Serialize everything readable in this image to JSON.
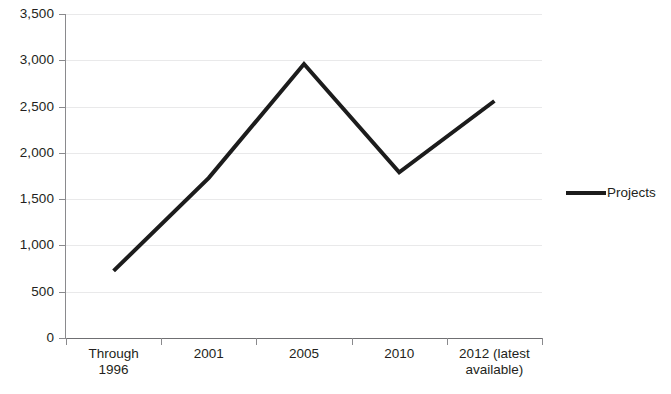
{
  "chart_data": {
    "type": "line",
    "title": "",
    "subtitle": "",
    "xlabel": "",
    "ylabel": "",
    "categories": [
      "Through 1996",
      "2001",
      "2005",
      "2010",
      "2012 (latest available)"
    ],
    "category_lines": [
      [
        "Through",
        "1996"
      ],
      [
        "2001"
      ],
      [
        "2005"
      ],
      [
        "2010"
      ],
      [
        "2012 (latest",
        "available)"
      ]
    ],
    "series": [
      {
        "name": "Projects",
        "values": [
          725,
          1730,
          2960,
          1790,
          2560
        ],
        "color": "#1c1c1c",
        "line_width": 4
      }
    ],
    "ylim": [
      0,
      3500
    ],
    "ytick_step": 500,
    "ytick_values": [
      0,
      500,
      1000,
      1500,
      2000,
      2500,
      3000,
      3500
    ],
    "ytick_labels": [
      "0",
      "500",
      "1,000",
      "1,500",
      "2,000",
      "2,500",
      "3,000",
      "3,500"
    ],
    "grid": true,
    "grid_axis": "y",
    "grid_color": "#e9e9ea",
    "axis_color": "#8a8a8d",
    "legend": {
      "position": "right",
      "entries": [
        {
          "label": "Projects",
          "color": "#1c1c1c"
        }
      ]
    },
    "background": "#ffffff"
  }
}
